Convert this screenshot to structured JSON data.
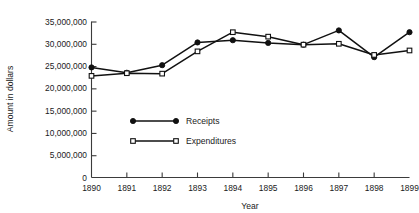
{
  "chart_data": {
    "type": "line",
    "title": "",
    "xlabel": "Year",
    "ylabel": "Amount in dollars",
    "categories": [
      "1890",
      "1891",
      "1892",
      "1893",
      "1894",
      "1895",
      "1896",
      "1897",
      "1898",
      "1899"
    ],
    "x": [
      1890,
      1891,
      1892,
      1893,
      1894,
      1895,
      1896,
      1897,
      1898,
      1899
    ],
    "series": [
      {
        "name": "Receipts",
        "marker": "filled-circle",
        "values": [
          24700000,
          23500000,
          25200000,
          30300000,
          30800000,
          30200000,
          29800000,
          33000000,
          27000000,
          32600000
        ]
      },
      {
        "name": "Expenditures",
        "marker": "open-square",
        "values": [
          22800000,
          23400000,
          23300000,
          28300000,
          32600000,
          31600000,
          29800000,
          30000000,
          27500000,
          28500000
        ]
      }
    ],
    "ylim": [
      0,
      35000000
    ],
    "yticks": [
      0,
      5000000,
      10000000,
      15000000,
      20000000,
      25000000,
      30000000,
      35000000
    ],
    "ytick_labels": [
      "0",
      "5,000,000",
      "10,000,000",
      "15,000,000",
      "20,000,000",
      "25,000,000",
      "30,000,000",
      "35,000,000"
    ],
    "xlim": [
      1890,
      1899
    ],
    "grid": false,
    "legend_position": "center-left-inside",
    "colors": {
      "axis": "#3b3b3b",
      "series_receipts": "#111111",
      "series_expenditures": "#111111",
      "background": "#ffffff"
    }
  },
  "legend": {
    "entries": [
      {
        "label": "Receipts"
      },
      {
        "label": "Expenditures"
      }
    ]
  }
}
